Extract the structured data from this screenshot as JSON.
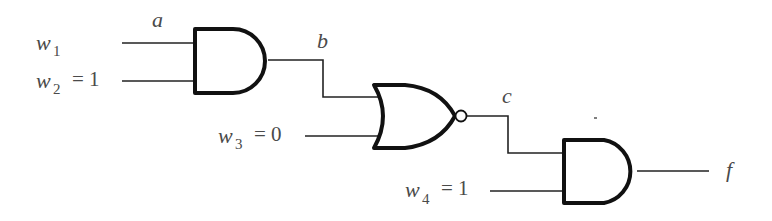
{
  "diagram": {
    "type": "logic-circuit",
    "inputs": [
      {
        "name": "w",
        "sub": "1",
        "value": ""
      },
      {
        "name": "w",
        "sub": "2",
        "value": "= 1"
      },
      {
        "name": "w",
        "sub": "3",
        "value": "= 0"
      },
      {
        "name": "w",
        "sub": "4",
        "value": "= 1"
      }
    ],
    "signals": {
      "a": "a",
      "b": "b",
      "c": "c",
      "f": "f"
    },
    "gates": [
      {
        "id": "and1",
        "type": "AND",
        "inputs": [
          "w1",
          "w2"
        ],
        "output": "b"
      },
      {
        "id": "nor1",
        "type": "NOR",
        "inputs": [
          "b",
          "w3"
        ],
        "output": "c"
      },
      {
        "id": "and2",
        "type": "AND",
        "inputs": [
          "c",
          "w4"
        ],
        "output": "f"
      }
    ]
  }
}
